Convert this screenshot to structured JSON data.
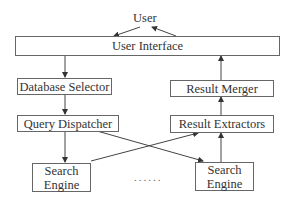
{
  "diagram": {
    "user": "User",
    "nodes": {
      "user_interface": "User Interface",
      "database_selector": "Database Selector",
      "query_dispatcher": "Query Dispatcher",
      "search_engine_left_1": "Search",
      "search_engine_left_2": "Engine",
      "search_engine_right_1": "Search",
      "search_engine_right_2": "Engine",
      "result_extractors": "Result Extractors",
      "result_merger": "Result Merger"
    },
    "ellipsis": "......",
    "edges": [
      {
        "from": "User",
        "to": "User Interface"
      },
      {
        "from": "User Interface",
        "to": "User"
      },
      {
        "from": "User Interface",
        "to": "Database Selector"
      },
      {
        "from": "Database Selector",
        "to": "Query Dispatcher"
      },
      {
        "from": "Query Dispatcher",
        "to": "Search Engine (left)"
      },
      {
        "from": "Query Dispatcher",
        "to": "Search Engine (right)"
      },
      {
        "from": "Search Engine (left)",
        "to": "Result Extractors"
      },
      {
        "from": "Search Engine (right)",
        "to": "Result Extractors"
      },
      {
        "from": "Result Extractors",
        "to": "Result Merger"
      },
      {
        "from": "Result Merger",
        "to": "User Interface"
      }
    ]
  }
}
